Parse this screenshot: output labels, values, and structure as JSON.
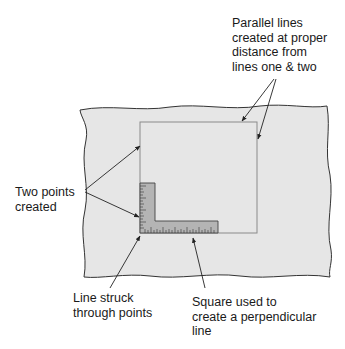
{
  "labels": {
    "parallel_lines": "Parallel lines\ncreated at proper\ndistance from\nlines one & two",
    "two_points": "Two points\ncreated",
    "line_struck": "Line struck\nthrough points",
    "square_used": "Square used to\ncreate a perpendicular\nline"
  },
  "colors": {
    "paper_fill": "#e6e6e6",
    "paper_outline": "#333333",
    "square_outline": "#8a8a8a",
    "tool_fill": "#b4b4b4",
    "tool_outline": "#444444",
    "arrow": "#222222"
  }
}
